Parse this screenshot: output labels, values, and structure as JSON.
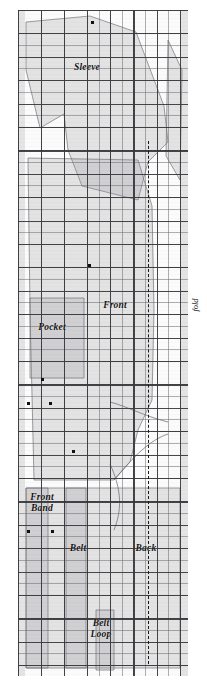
{
  "diagram": {
    "type": "sewing-pattern-cutting-layout",
    "fabric": {
      "grid": true,
      "grid_cell_px": 11.6,
      "bold_every": 2
    },
    "edge_labels": {
      "left": "selvedges",
      "right": "fold"
    },
    "pieces": [
      {
        "id": "sleeve",
        "label": "Sleeve",
        "label_x": 72,
        "label_y": 62
      },
      {
        "id": "front",
        "label": "Front",
        "label_x": 100,
        "label_y": 300
      },
      {
        "id": "pocket",
        "label": "Pocket",
        "label_x": 35,
        "label_y": 322
      },
      {
        "id": "front-band",
        "label": "Front\nBand",
        "label_x": 22,
        "label_y": 492
      },
      {
        "id": "belt",
        "label": "Belt",
        "label_x": 61,
        "label_y": 543
      },
      {
        "id": "back",
        "label": "Back",
        "label_x": 128,
        "label_y": 543
      },
      {
        "id": "belt-loop",
        "label": "Belt\nLoop",
        "label_x": 82,
        "label_y": 618
      }
    ],
    "fold_line": {
      "name": "fold-line",
      "x": 148,
      "style": "dashed",
      "segments": [
        {
          "top": 141,
          "height": 121
        },
        {
          "top": 264,
          "height": 199
        },
        {
          "top": 466,
          "height": 198
        }
      ]
    },
    "markers": [
      {
        "name": "notch-dot",
        "x": 91,
        "y": 21
      },
      {
        "name": "notch-dot",
        "x": 88,
        "y": 264
      },
      {
        "name": "notch-dot",
        "x": 41,
        "y": 378
      },
      {
        "name": "notch-dot",
        "x": 27,
        "y": 402
      },
      {
        "name": "notch-dot",
        "x": 49,
        "y": 402
      },
      {
        "name": "notch-dot",
        "x": 27,
        "y": 530
      },
      {
        "name": "notch-dot",
        "x": 51,
        "y": 530
      },
      {
        "name": "notch-dot",
        "x": 72,
        "y": 450
      }
    ],
    "colors": {
      "fabric": "#fbfbfb",
      "grid_fine": "#6e6e73",
      "grid_bold": "#37373c",
      "piece_fill": "#96969b",
      "ink": "#111111"
    }
  }
}
